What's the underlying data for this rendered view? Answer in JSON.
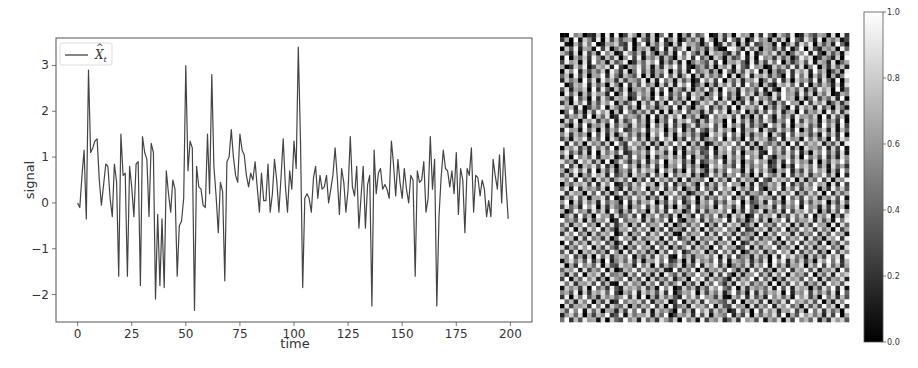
{
  "chart_data": [
    {
      "type": "line",
      "title": "",
      "xlabel": "time",
      "ylabel": "signal",
      "xlim": [
        -10,
        210
      ],
      "ylim": [
        -2.6,
        3.6
      ],
      "xticks": [
        0,
        25,
        50,
        75,
        100,
        125,
        150,
        175,
        200
      ],
      "yticks": [
        -2,
        -1,
        0,
        1,
        2,
        3
      ],
      "grid": false,
      "legend": {
        "position": "upper left",
        "entries": [
          "X̂ₜ"
        ]
      },
      "series": [
        {
          "name": "X̂ₜ",
          "color": "#444444",
          "x": [
            0,
            1,
            2,
            3,
            4,
            5,
            6,
            7,
            8,
            9,
            10,
            11,
            12,
            13,
            14,
            15,
            16,
            17,
            18,
            19,
            20,
            21,
            22,
            23,
            24,
            25,
            26,
            27,
            28,
            29,
            30,
            31,
            32,
            33,
            34,
            35,
            36,
            37,
            38,
            39,
            40,
            41,
            42,
            43,
            44,
            45,
            46,
            47,
            48,
            49,
            50,
            51,
            52,
            53,
            54,
            55,
            56,
            57,
            58,
            59,
            60,
            61,
            62,
            63,
            64,
            65,
            66,
            67,
            68,
            69,
            70,
            71,
            72,
            73,
            74,
            75,
            76,
            77,
            78,
            79,
            80,
            81,
            82,
            83,
            84,
            85,
            86,
            87,
            88,
            89,
            90,
            91,
            92,
            93,
            94,
            95,
            96,
            97,
            98,
            99,
            100,
            101,
            102,
            103,
            104,
            105,
            106,
            107,
            108,
            109,
            110,
            111,
            112,
            113,
            114,
            115,
            116,
            117,
            118,
            119,
            120,
            121,
            122,
            123,
            124,
            125,
            126,
            127,
            128,
            129,
            130,
            131,
            132,
            133,
            134,
            135,
            136,
            137,
            138,
            139,
            140,
            141,
            142,
            143,
            144,
            145,
            146,
            147,
            148,
            149,
            150,
            151,
            152,
            153,
            154,
            155,
            156,
            157,
            158,
            159,
            160,
            161,
            162,
            163,
            164,
            165,
            166,
            167,
            168,
            169,
            170,
            171,
            172,
            173,
            174,
            175,
            176,
            177,
            178,
            179,
            180,
            181,
            182,
            183,
            184,
            185,
            186,
            187,
            188,
            189,
            190,
            191,
            192,
            193,
            194,
            195,
            196,
            197,
            198,
            199
          ],
          "values": [
            0.0,
            -0.1,
            0.6,
            1.15,
            -0.35,
            2.9,
            1.1,
            1.2,
            1.35,
            1.4,
            0.5,
            -0.05,
            0.4,
            0.85,
            0.8,
            0.1,
            -0.3,
            0.85,
            0.45,
            -1.6,
            1.5,
            0.6,
            0.65,
            -1.6,
            0.8,
            0.35,
            -0.3,
            0.85,
            0.9,
            -1.8,
            1.45,
            1.1,
            0.95,
            -0.3,
            1.3,
            1.1,
            -2.1,
            -0.25,
            -1.8,
            -0.35,
            -1.85,
            0.7,
            0.2,
            -0.2,
            0.5,
            0.3,
            -1.6,
            -0.5,
            -0.4,
            0.1,
            3.0,
            0.7,
            1.35,
            1.2,
            -2.35,
            0.8,
            0.35,
            0.3,
            -0.05,
            -0.1,
            1.5,
            0.2,
            2.8,
            0.8,
            0.15,
            -0.65,
            0.45,
            0.25,
            -1.7,
            0.9,
            1.0,
            1.6,
            1.0,
            0.6,
            0.45,
            1.5,
            1.15,
            1.05,
            0.6,
            0.35,
            0.65,
            0.5,
            0.9,
            0.35,
            -0.2,
            0.65,
            0.05,
            0.05,
            0.85,
            -0.2,
            0.2,
            0.95,
            0.5,
            -0.2,
            0.55,
            1.4,
            0.4,
            -0.2,
            0.7,
            0.3,
            1.35,
            0.75,
            3.4,
            1.35,
            -1.85,
            0.1,
            0.2,
            0.1,
            -0.2,
            0.55,
            0.8,
            0.1,
            0.6,
            0.3,
            0.35,
            0.6,
            0.0,
            0.3,
            0.6,
            1.2,
            0.55,
            -0.25,
            0.75,
            0.45,
            -0.2,
            0.3,
            1.45,
            0.35,
            0.15,
            0.8,
            -0.55,
            0.15,
            0.8,
            -0.55,
            0.4,
            0.6,
            -2.25,
            1.15,
            0.2,
            0.65,
            0.75,
            0.3,
            0.4,
            0.3,
            0.1,
            1.35,
            0.85,
            0.15,
            0.95,
            0.45,
            0.1,
            0.75,
            0.3,
            0.0,
            0.6,
            0.5,
            -1.6,
            0.7,
            0.45,
            0.5,
            0.9,
            -0.2,
            0.1,
            1.45,
            0.3,
            0.95,
            -2.25,
            -0.3,
            0.55,
            1.15,
            0.75,
            0.7,
            0.35,
            0.7,
            0.2,
            1.1,
            -0.25,
            0.75,
            0.5,
            -0.65,
            0.75,
            0.6,
            1.2,
            -0.2,
            0.6,
            0.55,
            0.15,
            0.5,
            0.3,
            -0.3,
            0.05,
            -0.3,
            0.95,
            0.6,
            0.3,
            1.05,
            0.0,
            1.2,
            0.4,
            -0.35,
            -0.55,
            0.7,
            0.35,
            0.6,
            0.9,
            0.55,
            0.45,
            1.0,
            0.4,
            -0.1,
            1.2
          ]
        }
      ]
    },
    {
      "type": "heatmap",
      "title": "",
      "colormap": "gray",
      "rows": 64,
      "cols": 64,
      "vmin": 0.0,
      "vmax": 1.0,
      "colorbar": {
        "ticks": [
          "0.0",
          "0.2",
          "0.4",
          "0.6",
          "0.8",
          "1.0"
        ],
        "position": "right"
      },
      "encoding": "each row is 64 hex digits, value = digit/15",
      "values": [
        "00f8a032c0e1f04d90b2c07f1e0a3d58f02c4b0e9a1d3f60c85e02b74a91d0e3",
        "3a0f1c82e0d4b59a0e73c1f28d04a6b1e90c3f72d05e8a1b4c0f63d92e0a7b14",
        "e10b4d7f02a9c53e08f1b6d40c2e9a718f03d5c0b2e46a91f07c3d8e0b5a2f61",
        "0c5e2a91f4d07b3e0a8c16f2d49e0b7a3c510fe82d6b0a94c3e17f0d52a8b0e6",
        "b72d0e4a1f8c03e95b2d70a4c1f6e83b0d9a52c4f0e17b8d3a06c9f2e40b5a1d",
        "1f0a6c3e82b5d09f4e1a7c2b60d8e3f5a0c91b47e2d0f8a3c5b16e9d04a72c0f",
        "4e9b0d2f7a1c58e03b6d9f1a4c2e07b85d3f0a9c61e2b4d7f0a38c5e1b92d06a",
        "a03c7e15b9d2f40a8e6c1b3d9f5e207a4c0b8d1e63f9a02c7b5e4d18f0a3c6b2",
        "0d8f2b4a6c1e93d07f5b2a8e0c4d1f69b3a0e72c5d8f1b0a46e3c9d2f7b05a1e",
        "6b1e4c0a9f3d72b85e0c1a4f6d29e0b3c7a5f1d08e2b9c4a60f3e7d1b5c0a28f",
        "2c7a0f5d1e8b3c4a96e0d2f7b1c5a03e8d4f0b6c2a9e17d5f3b0c8a4e2d61f0b",
        "f04b9e2c6a0d81f3b5e7a0c4d2e9f16b0a3c8d5e2f7a0b41c9d6e3f0a5b82c1d",
        "5d2a8c0f3e61b4d09a7c2e5f0b83d1a6e4c0f9b2d7a5e1c30f8b6d2a4e9c0f17",
        "0e6c1b4d9a2f07e35c8b0d1f4a6e2c9b07d3f5a1e8c2b40d6f9a3e5c1b7d02a8",
        "c81f5a0e3d72b9c04e6a1f8d2b5c0e93a7f1d4b06c2e8a5d3f9b0c17e4a6d2f0",
        "3a0d7e2b5c9f1a48e0c6d3b1f7a2e05c9d4b8f0a3e6c1d72b5f9a0e4c8d16b3a",
        "d9b2e04a6f1c83d5b0e7a29c4f1d60b8e3a5c2f0d9b7e1a4c60f3d8b2e5a0c71",
        "07f3a1c5e9d0b2f84a6c3e0d1b7f5a92c4e8d0b6f1a3c5e7d29b0f4a8c1e6d3b",
        "e4a8c2f0b6d13e7a95c0f2b4d8e1a6c03f7b9d5e2a0c4f81d6b3e9a7c0f2d5b1",
        "1c5e0b9d3a7f2c48e6b1d0a5f3c9e72b4d8a0f1e6c3b5d92a7f0e4c8b1d6a3f0",
        "b60d4f2a8c1e5b93d7a0f6c2e4b18d3a9f5c0e7b2d4a61f8c3e0b9d5a2f7c1e4",
        "2f9a1e6c0d4b7f35a8e2c9d0b6f1a4e73c5d8b0f2a9e1c64d7b3f0a5e8c2d1b6",
        "8d3b7a0f5e2c19d6b4a0e8f3c1d7b5a20e9c4f6d1b3a8e0c72f5d9b4a1e6c3f0",
        "4a1c9e3b6f0d82a7e5c1b4f9d0a3e6c28b7f1d5a0e4c9b36f2d8a1e7c5b0f4d9",
        "f2e6b0d8a4c1f73e9b5d2a0c6f8e1b4d03a7c9f5e2b1d86a4c0f3e7b9d2a5c1e",
        "0b8d4a2e7c5f1b39d6a0e4c8f2b1d7a53e0c9f6b4d2a18e7c5f3b0d9a6e2c4f1",
        "9e5a3c1f0d7b6e24a8c5f9b3d0e1a7c46f2b8d5e0a9c31f7b4d6e2a0c8f5b3d1",
        "3c0f8b6e2a9d15c4f7b0e3a8d6c2f1b94e5a0d7c3f8b2e61a9d4c0f7b5e3a2d8",
        "d7a2e9c4b1f06d83a5e2b7f0c9d4a1e36b8f2c5d0a7e9b14c3f6d8a2e0b5c9f7",
        "6f4c1b8d5e3a09f7c2b6e4d1a8f3c5b02e9d7a4f1c6b8e35d0a2f9c7e4b1d6a3",
        "a19e7d3f0b5c28a4e6d9b1f7c3a0e5d82c4b6f9a1d3e7c50b8f2a4d6e9c1b3f7",
        "5b3d0a6e9c2f47b1d8a3e5c0f6b9d2a14e7c3b8f5a0d2e96c1f4b7d3a8e5c0f2",
        "c8e2f5a1d7b39c6e0a4f2d8b5c1e3a97f0d6b2e4c8a1f53d9b7e0c2a6f4d1b8e",
        "0a6b9c4e2d8f13a5c7e9b0d4f2a6c81e3b5d7f9a0c2e46b8d1f3a5c7e9b0d2f4",
        "7d1f3b8a5c0e62d4b9f1a7e3c5d08b2f6a4e9c1d7b3f50a8e2c6d4b9f1a3e7c5",
        "e3c9a0d6f4b18e2c5a7d3f0b9e6c14a8d2f5b7e0c3a96d1f4b8e2a5c7d0f3b6a",
        "2b7e5c1a9d3f04b6e8c2a5d1f7b39e0c4a6d8f2b5e17c9a3d0f6b4e8c2a7d5f1",
        "9f0c4d7b2e6a81f3c5b9e0a4d6f27c1b8e3a5d9f0c46b2e7a1d8f3c5b9e0a4d6",
        "4d6a2f9e0c3b75d1a8f4c6e2b0d93f5a7c1e8b4d2f60a9c3e5b7d1f8a2c4e6b0",
        "b05e8a3d6c1f92b4e7a0d5c3f8b16e2d4a9c7f0b3e58d1a6c2f4b9e7d0a3c5f8",
        "18c3f6b0e9a2d57c4f1b8e6a3d0c92f5b7e4a1d8c03f6b9e2a5d7c4f1b8e0a3d",
        "f7a5d1c4b8e03f6a9d2c5b7e1f40a8d3c6b9f2e5a17d4c0b8f3e6a9d2c5b1f7e",
        "6c2b9f7a0e5d38c1b4f6a9e2d07c5b8f1a3e4d9c26b0f7a5e8d1c3b4f9a0e2d6",
        "a4e0c3d8f2b61a9e5c7d0b4f3a82e6c1d5b9f7a0e34c8d2b6f1a5e9c3d7b0f4a",
        "3d8f6a1c5b9e04d2a7f3c8e5b10d6a9f2c4e7b3d58a1f0c6e9b2d4a7f3c5e8b1",
        "e9b1d4e7a3c06f8b2d5a9c1e4f37b0d6a8c2f5e1b93d4a7c0f6b8e2d5a1c9f3e",
        "0f5c7b2d9e4a16f3c8b0e5a2d7f94c1b6e3a8d0f25c7b9e4a1d6f3c8b2e0a5d7",
        "c2a6e9f1b4d73c0a5e8b2f6d1a49e3c7b0f5d8a26e1c4b9f3a7d0e5c2b8f6a1d",
        "5e3d0b8c6a2f91e4d7b3a0c5f8e26b9d1a4f7c3e05b8d2a6f9c1e4b7d3a0f5c8",
        "b8f4a2c0e6d39b7f1a5c4e8d20f6b3a9c7e1d5f48a2c6b0e3f9d7a1c5b4e8d2f",
        "19d7c5e3a0f28b6d4c1a9e7f35b0c2d8a6f4e1b97c3a5d0f8e2b6c4a1d9f7e3b",
        "d0a3f8b6e1c54d9a2f7c0e3b68d1a5f2c9e4b07a6d3c8f1e5b2a9d0c7f4e6b3a",
        "6b9e2d4a7f1c03b8e5d9a6c21f4b7e0d3a8c5f92b1e6d4a0c7f3b9e5d2a8c1f6",
        "a2c5f0b9d3e78a1c6f4b2d0e95c3a7f8b1d4e60c2a9f5b3d7e1c8a4f0b6d2e9c",
        "4f1b6e8c2a0d97f3b5e1c4a6d28b0f9e3c7a51d4b8f2e6c0a3d9b5f7e1c4a8d2",
        "e7d3a9c5f4b10e6d8a2c7f3b59e1a4d0c6f83b2e9d5a7c1f0b4e8d3a6c2f9b5e",
        "1c8b4d0f6a3e52c9b7d4a1f8e03c6b2a5d9f74e0c3b8a6d1f5e2c9b0a4d7f3e1",
        "8a5e1c3b9d6f40a7e2c8b5d3f16a9e0c4b7d28f5a1e3c6b9d0f2a8e4c7b5d1f6",
        "3e0d7f5a2c8b69e4d1f0a3c7b52e8d6f9a4c10b7e3d5a2f8c6b1e9d4a0f7c3b5",
        "f6b2c8e0a4d13f7b9c5e2a8d04f1b6c3e9a75d2f0b8c4e1a6d3f9b7c5e0a2d8f",
        "0d4a9b3f7e2c86d1a5b8f4c0e37a2d9b6f1c54e8a0d3b7f2c9e6a1d5b4f8c0e3",
        "b5e8f1d6c0a92b4e7f3d1c8a60e5b2f9d4c7a13e6b0f5d8c2a9e4b1f7d3c6a0e",
        "29c6d0a4b8f35e1c7a9d2b6f04a8c3e5d1b97f2a4e0c6b8d3f1a5e9c7b2d4f0a",
        "7f3b5e9a1d0c64f8b2e6a3d95c0f7b1e4a8d26c3f9b5e1a7d0c4f8b6e2a3d9c5"
      ]
    }
  ],
  "left_plot": {
    "xlabel": "time",
    "ylabel": "signal",
    "legend_label_base": "X",
    "legend_label_sub": "t",
    "xtick_labels": [
      "0",
      "25",
      "50",
      "75",
      "100",
      "125",
      "150",
      "175",
      "200"
    ],
    "ytick_labels": [
      "−2",
      "−1",
      "0",
      "1",
      "2",
      "3"
    ]
  },
  "colorbar": {
    "tick_labels": [
      "0.0",
      "0.2",
      "0.4",
      "0.6",
      "0.8",
      "1.0"
    ]
  }
}
